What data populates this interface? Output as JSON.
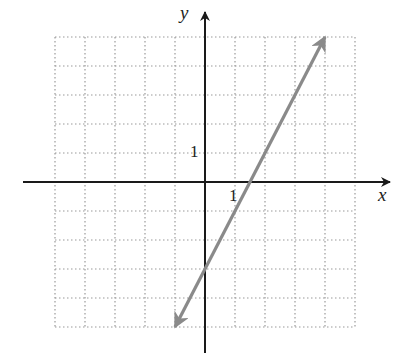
{
  "chart_data": {
    "type": "line",
    "title": "",
    "xlabel": "x",
    "ylabel": "y",
    "xlim": [
      -5,
      5
    ],
    "ylim": [
      -5,
      5
    ],
    "grid": true,
    "tick_labels": {
      "x": "1",
      "y": "1"
    },
    "series": [
      {
        "name": "line",
        "equation": "y = 2x - 3",
        "x": [
          -1,
          4
        ],
        "y": [
          -5,
          5
        ],
        "color": "#8a8a8a",
        "arrows": "both"
      }
    ]
  },
  "labels": {
    "x_axis": "x",
    "y_axis": "y",
    "x_tick": "1",
    "y_tick": "1"
  },
  "colors": {
    "axis": "#1a1a1a",
    "grid": "#9a9a9a",
    "line": "#8a8a8a"
  }
}
